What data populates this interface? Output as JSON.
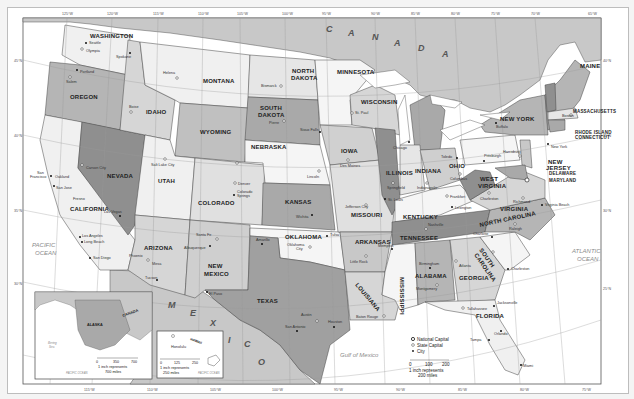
{
  "map": {
    "title": "United States (political reference map)",
    "colors": {
      "water": "#ffffff",
      "land_light": "#f0f0f0",
      "land_mid": "#d6d6d6",
      "land_dark": "#a9a9a9",
      "land_darker": "#8f8f8f",
      "canada_mexico": "#c8c8c8",
      "border": "#444444",
      "grid": "#9a9a9a"
    },
    "top_longitude_ticks": [
      "125°W",
      "120°W",
      "115°W",
      "110°W",
      "105°W",
      "100°W",
      "95°W",
      "90°W",
      "85°W",
      "80°W",
      "75°W",
      "70°W",
      "65°W"
    ],
    "bottom_longitude_ticks": [
      "115°W",
      "110°W",
      "105°W",
      "100°W",
      "95°W",
      "90°W",
      "85°W",
      "80°W",
      "75°W"
    ],
    "latitude_ticks": [
      "50°N",
      "45°N",
      "40°N",
      "35°N",
      "30°N",
      "25°N"
    ],
    "countries": {
      "canada": [
        "C",
        "A",
        "N",
        "A",
        "D",
        "A"
      ],
      "mexico": [
        "M",
        "E",
        "X",
        "I",
        "C",
        "O"
      ]
    },
    "oceans": {
      "pacific": [
        "PACIFIC",
        "OCEAN"
      ],
      "atlantic": [
        "ATLANTIC",
        "OCEAN"
      ],
      "gulf": "Gulf of Mexico"
    },
    "states": {
      "washington": "WASHINGTON",
      "oregon": "OREGON",
      "california": "CALIFORNIA",
      "nevada": "NEVADA",
      "idaho": "IDAHO",
      "montana": "MONTANA",
      "wyoming": "WYOMING",
      "utah": "UTAH",
      "colorado": "COLORADO",
      "arizona": "ARIZONA",
      "new_mexico": [
        "NEW",
        "MEXICO"
      ],
      "north_dakota": [
        "NORTH",
        "DAKOTA"
      ],
      "south_dakota": [
        "SOUTH",
        "DAKOTA"
      ],
      "nebraska": "NEBRASKA",
      "kansas": "KANSAS",
      "oklahoma": "OKLAHOMA",
      "texas": "TEXAS",
      "minnesota": "MINNESOTA",
      "iowa": "IOWA",
      "missouri": "MISSOURI",
      "arkansas": "ARKANSAS",
      "louisiana": "LOUISIANA",
      "wisconsin": "WISCONSIN",
      "illinois": "ILLINOIS",
      "mississippi": "MISSISSIPPI",
      "michigan": "MICHIGAN",
      "indiana": "INDIANA",
      "kentucky": "KENTUCKY",
      "tennessee": "TENNESSEE",
      "alabama": "ALABAMA",
      "ohio": "OHIO",
      "georgia": "GEORGIA",
      "florida": "FLORIDA",
      "south_carolina": [
        "SOUTH",
        "CAROLINA"
      ],
      "north_carolina": "NORTH CAROLINA",
      "virginia": "VIRGINIA",
      "west_virginia": [
        "WEST",
        "VIRGINIA"
      ],
      "pennsylvania": "PENNSYLVANIA",
      "new_york": "NEW YORK",
      "new_jersey": [
        "NEW",
        "JERSEY"
      ],
      "delaware": "DELAWARE",
      "maryland": "MARYLAND",
      "connecticut": "CONNECTICUT",
      "rhode_island": "RHODE ISLAND",
      "massachusetts": "MASSACHUSETTS",
      "vermont": "VERMONT",
      "new_hampshire": "NEW HAMPSHIRE",
      "maine": "MAINE",
      "alaska": "ALASKA",
      "hawaii": "HAWAII"
    },
    "cities": {
      "seattle": "Seattle",
      "olympia": "Olympia",
      "spokane": "Spokane",
      "portland": "Portland",
      "salem": "Salem",
      "boise": "Boise",
      "helena": "Helena",
      "bismarck": "Bismarck",
      "pierre": "Pierre",
      "sioux_falls": "Sioux Falls",
      "carson_city": "Carson City",
      "sacramento": "Sacramento",
      "san_francisco": [
        "San",
        "Francisco"
      ],
      "oakland": "Oakland",
      "san_jose": "San Jose",
      "fresno": "Fresno",
      "las_vegas": "Las Vegas",
      "los_angeles": "Los Angeles",
      "long_beach": "Long Beach",
      "san_diego": "San Diego",
      "salt_lake_city": "Salt Lake City",
      "cheyenne": "Cheyenne",
      "denver": "Denver",
      "colorado_springs": [
        "Colorado",
        "Springs"
      ],
      "phoenix": "Phoenix",
      "mesa": "Mesa",
      "tucson": "Tucson",
      "santa_fe": "Santa Fe",
      "albuquerque": "Albuquerque",
      "el_paso": "El Paso",
      "lincoln": "Lincoln",
      "omaha": "Omaha",
      "wichita": "Wichita",
      "topeka": "Topeka",
      "kansas_city": "Kansas City",
      "oklahoma_city": [
        "Oklahoma",
        "City"
      ],
      "tulsa": "Tulsa",
      "amarillo": "Amarillo",
      "fort_worth": "Fort Worth",
      "dallas": "Dallas",
      "austin": "Austin",
      "san_antonio": "San Antonio",
      "houston": "Houston",
      "st_paul": "St. Paul",
      "minneapolis": "Minneapolis",
      "des_moines": "Des Moines",
      "jefferson_city": "Jefferson City",
      "st_louis": "St. Louis",
      "little_rock": "Little Rock",
      "baton_rouge": "Baton Rouge",
      "new_orleans": "New Orleans",
      "jackson": "Jackson",
      "madison": "Madison",
      "milwaukee": "Milwaukee",
      "chicago": "Chicago",
      "springfield": "Springfield",
      "indianapolis": "Indianapolis",
      "detroit": "Detroit",
      "lansing": "Lansing",
      "toledo": "Toledo",
      "cleveland": "Cleveland",
      "columbus": "Columbus",
      "cincinnati": "Cincinnati",
      "frankfort": "Frankfort",
      "louisville": "Louisville",
      "lexington": "Lexington",
      "nashville": "Nashville",
      "memphis": "Memphis",
      "birmingham": "Birmingham",
      "montgomery": "Montgomery",
      "mobile": "Mobile",
      "atlanta": "Atlanta",
      "tallahassee": "Tallahassee",
      "jacksonville": "Jacksonville",
      "orlando": "Orlando",
      "tampa": "Tampa",
      "miami": "Miami",
      "savannah": "Savannah",
      "charleston_sc": "Charleston",
      "columbia": "Columbia",
      "charlotte": "Charlotte",
      "raleigh": "Raleigh",
      "richmond": "Richmond",
      "virginia_beach": "Virginia Beach",
      "charleston_wv": "Charleston",
      "pittsburgh": "Pittsburgh",
      "harrisburg": "Harrisburg",
      "philadelphia": "Philadelphia",
      "buffalo": "Buffalo",
      "albany": "Albany",
      "new_york": [
        "New York",
        "City"
      ],
      "trenton": "Trenton",
      "dover": "Dover",
      "boston": "Boston",
      "hartford": "Hartford",
      "providence": "Providence",
      "concord": "Concord",
      "montpelier": "Montpelier",
      "augusta": "Augusta",
      "honolulu": "Honolulu",
      "anchorage": "Anchorage",
      "juneau": "Juneau",
      "washington_dc": "Washington"
    },
    "legend": {
      "national_capital": "National Capital",
      "state_capital": "State Capital",
      "city": "City",
      "scale_ticks": [
        "0",
        "100",
        "200"
      ],
      "scale_line1": "1 inch represents",
      "scale_line2": "200 miles"
    },
    "alaska_inset": {
      "country": "CANADA",
      "state": "ALASKA",
      "sea": [
        "Bering",
        "Sea"
      ],
      "ocean": "PACIFIC OCEAN",
      "scale_ticks": [
        "0",
        "350",
        "700"
      ],
      "scale_line1": "1 inch represents",
      "scale_line2": "700 miles"
    },
    "hawaii_inset": {
      "state": "HAWAII",
      "ocean": "PACIFIC OCEAN",
      "scale_ticks": [
        "0",
        "125",
        "250"
      ],
      "scale_line1": "1 inch represents",
      "scale_line2": "250 miles"
    }
  }
}
